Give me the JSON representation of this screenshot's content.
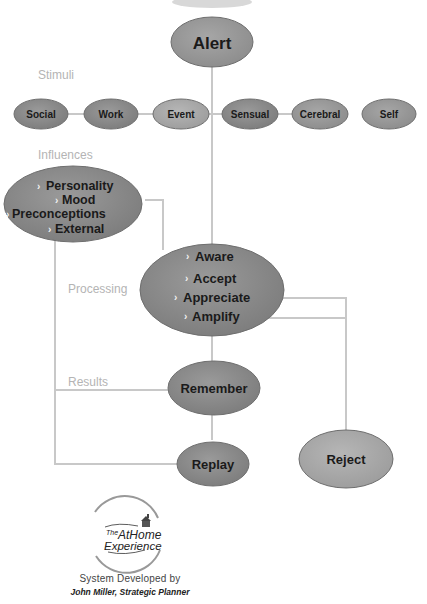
{
  "diagram": {
    "colors": {
      "node_dark": "#8a8a8a",
      "node_mid": "#969696",
      "node_light": "#a8a8a8",
      "connector": "#c8c8c8",
      "section_label": "#b4b4b4",
      "node_border": "#6e6e6e",
      "bullet": "#f2f2f2"
    },
    "top_node": {
      "label": "Alert"
    },
    "sections": {
      "stimuli": "Stimuli",
      "influences": "Influences",
      "processing": "Processing",
      "results": "Results"
    },
    "stimuli": [
      {
        "label": "Social"
      },
      {
        "label": "Work"
      },
      {
        "label": "Event"
      },
      {
        "label": "Sensual"
      },
      {
        "label": "Cerebral"
      },
      {
        "label": "Self"
      }
    ],
    "influences": {
      "bullet_icon": "chevron-right-icon",
      "items": [
        "Personality",
        "Mood",
        "Preconceptions",
        "External"
      ]
    },
    "processing": {
      "bullet_icon": "chevron-right-icon",
      "items": [
        "Aware",
        "Accept",
        "Appreciate",
        "Amplify"
      ]
    },
    "results": [
      {
        "label": "Remember"
      },
      {
        "label": "Replay"
      },
      {
        "label": "Reject"
      }
    ]
  },
  "logo": {
    "line1": "The",
    "line2": "AtHome",
    "line3": "Experience"
  },
  "credits": {
    "line1": "System Developed by",
    "line2": "John Miller, Strategic Planner"
  }
}
